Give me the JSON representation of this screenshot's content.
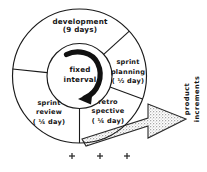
{
  "diagram": {
    "center": {
      "line1": "fixed",
      "line2": "interval"
    },
    "segments": [
      {
        "id": "development",
        "name": "development",
        "label": "development",
        "duration": "(9 days)"
      },
      {
        "id": "sprint-planning",
        "name": "sprint planning",
        "label_line1": "sprint",
        "label_line2": "planning",
        "duration": "( ½ day)"
      },
      {
        "id": "retrospective",
        "name": "retro spective",
        "label_line1": "retro",
        "label_line2": "spective",
        "duration": "( ¼ day)"
      },
      {
        "id": "sprint-review",
        "name": "sprint review",
        "label_line1": "sprint",
        "label_line2": "review",
        "duration": "( ¼ day)"
      }
    ],
    "output_arrow": {
      "label_line1": "product",
      "label_line2": "increments",
      "icon": "right-arrow-icon",
      "fill_style": "stipple"
    },
    "rotation_arrow": {
      "icon": "clockwise-arrow-icon",
      "direction": "clockwise"
    },
    "footer_marks": {
      "icon": "plus-mark-icon",
      "count": 3
    },
    "colors": {
      "ink": "#151515",
      "stroke": "#1a1a1a",
      "background": "#ffffff",
      "stipple": "#9a9a9a"
    }
  }
}
